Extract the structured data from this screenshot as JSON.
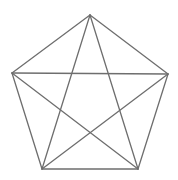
{
  "diagram": {
    "type": "pentagon-with-pentagram",
    "stroke_color": "#6e6e6e",
    "stroke_width": 1.3,
    "background": "#ffffff",
    "vertices": {
      "top": [
        90,
        15
      ],
      "left": [
        12,
        73
      ],
      "right": [
        168,
        74
      ],
      "bottom_left": [
        42,
        169
      ],
      "bottom_right": [
        138,
        169
      ]
    },
    "pentagon_edges": [
      [
        "top",
        "right"
      ],
      [
        "right",
        "bottom_right"
      ],
      [
        "bottom_right",
        "bottom_left"
      ],
      [
        "bottom_left",
        "left"
      ],
      [
        "left",
        "top"
      ]
    ],
    "star_diagonals": [
      [
        "top",
        "bottom_left"
      ],
      [
        "top",
        "bottom_right"
      ],
      [
        "left",
        "right"
      ],
      [
        "left",
        "bottom_right"
      ],
      [
        "right",
        "bottom_left"
      ]
    ]
  }
}
